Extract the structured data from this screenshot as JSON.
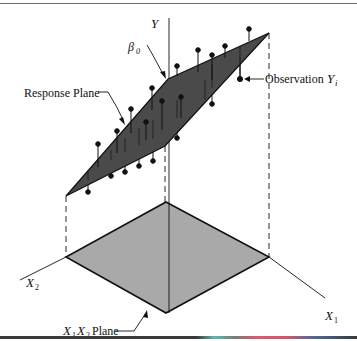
{
  "figure": {
    "labels": {
      "y_axis": "Y",
      "x1_axis": "X",
      "x1_sub": "1",
      "x2_axis": "X",
      "x2_sub": "2",
      "beta0": "β",
      "beta0_sub": "0",
      "response_plane": "Response Plane",
      "observation": "Observation",
      "observation_var": "Y",
      "observation_sub": "i",
      "x1x2_plane_a": "X",
      "x1x2_plane_a_sub": "1",
      "x1x2_plane_b": "X",
      "x1x2_plane_b_sub": "2",
      "x1x2_plane_word": "Plane"
    },
    "colors": {
      "response_plane_fill": "#4a4a4a",
      "x1x2_plane_fill": "#a9a9a9",
      "ink": "#111111",
      "background": "#ffffff"
    }
  }
}
